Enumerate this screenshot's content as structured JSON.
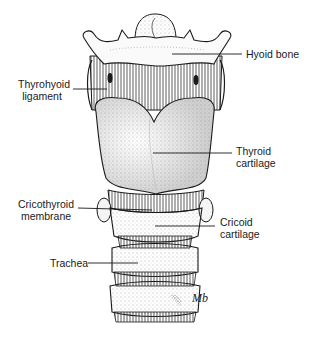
{
  "diagram": {
    "signature": "Mb",
    "labels": [
      {
        "id": "hyoid-bone",
        "lines": [
          "Hyoid bone"
        ]
      },
      {
        "id": "thyrohyoid-ligament",
        "lines": [
          "Thyrohyoid",
          "ligament"
        ]
      },
      {
        "id": "thyroid-cartilage",
        "lines": [
          "Thyroid",
          "cartilage"
        ]
      },
      {
        "id": "cricothyroid-membrane",
        "lines": [
          "Cricothyroid",
          "membrane"
        ]
      },
      {
        "id": "cricoid-cartilage",
        "lines": [
          "Cricoid",
          "cartilage"
        ]
      },
      {
        "id": "trachea",
        "lines": [
          "Trachea"
        ]
      }
    ]
  },
  "colors": {
    "ink": "#1a1a1a",
    "paper": "#ffffff",
    "shade": "#9a9a9a"
  }
}
